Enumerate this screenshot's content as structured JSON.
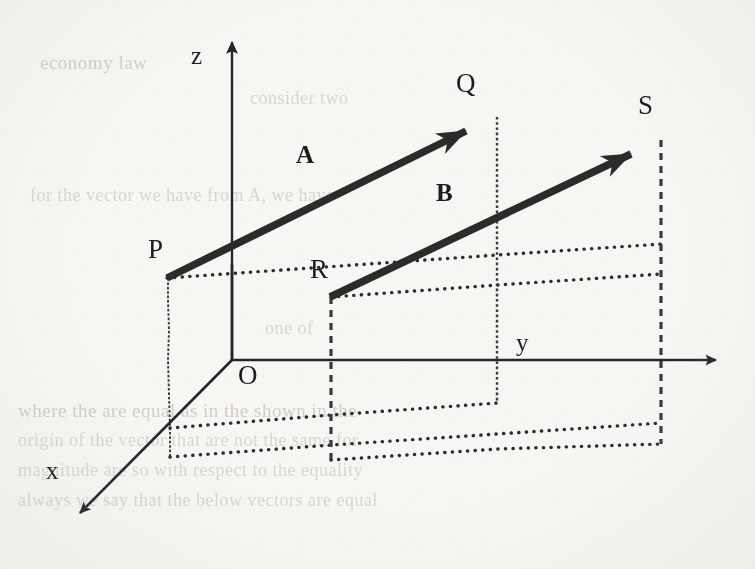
{
  "figure": {
    "kind": "3d-vector-diagram",
    "background_color": "#f7f6f3",
    "ink_color": "#262626"
  },
  "axes": {
    "origin_label": "O",
    "x_label": "x",
    "y_label": "y",
    "z_label": "z",
    "origin_px": [
      232,
      360
    ],
    "z_tip_px": [
      232,
      33
    ],
    "y_tip_px": [
      726,
      360
    ],
    "x_tip_px": [
      70,
      525
    ]
  },
  "vectors": [
    {
      "name": "A",
      "label": "A",
      "tail_label": "P",
      "head_label": "Q",
      "tail_px": [
        167,
        278
      ],
      "head_px": [
        495,
        117
      ],
      "label_px": [
        296,
        142
      ]
    },
    {
      "name": "B",
      "label": "B",
      "tail_label": "R",
      "head_label": "S",
      "tail_px": [
        330,
        297
      ],
      "head_px": [
        660,
        140
      ],
      "label_px": [
        436,
        180
      ]
    }
  ],
  "points": [
    {
      "label": "P",
      "px": [
        148,
        236
      ]
    },
    {
      "label": "Q",
      "px": [
        456,
        70
      ]
    },
    {
      "label": "R",
      "px": [
        310,
        256
      ]
    },
    {
      "label": "S",
      "px": [
        638,
        92
      ]
    },
    {
      "label": "O",
      "px": [
        238,
        362
      ]
    }
  ],
  "guides": {
    "style": "dotted-and-dashed projection lines",
    "note": "vertical drop lines from P, Q, R and S to the horizontal reference planes"
  }
}
